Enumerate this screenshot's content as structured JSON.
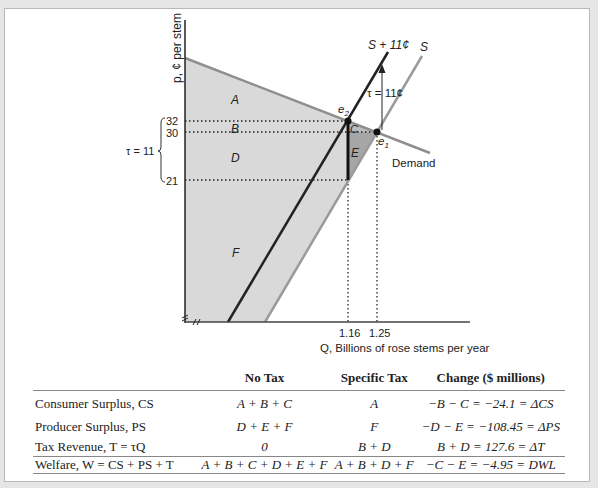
{
  "diagram": {
    "y_axis_label": "p, ¢ per stem",
    "x_axis_label": "Q, Billions of rose stems per year",
    "y_ticks": [
      "32",
      "30",
      "21"
    ],
    "x_ticks": [
      "1.16",
      "1.25"
    ],
    "tax_bracket_label": "τ = 11",
    "tax_arrow_label": "τ = 11¢",
    "curves": {
      "supply": "S",
      "supply_plus_tax": "S + 11¢",
      "demand": "Demand"
    },
    "points": {
      "e1": "e",
      "e1_sub": "1",
      "e2": "e",
      "e2_sub": "2"
    },
    "regions": {
      "A": "A",
      "B": "B",
      "C": "C",
      "D": "D",
      "E": "E",
      "F": "F"
    },
    "colors": {
      "surplus_fill": "#d9d9d9",
      "dwl_fill": "#a6a6a6",
      "supply_line": "#9a9a9a",
      "supply_tax_line": "#222222",
      "demand_line": "#8e8e8e",
      "axis": "#222222"
    }
  },
  "table": {
    "headers": [
      "",
      "No Tax",
      "Specific Tax",
      "Change ($ millions)"
    ],
    "rows": [
      {
        "label": "Consumer Surplus, CS",
        "no_tax": "A + B + C",
        "specific_tax": "A",
        "change": "−B − C = −24.1 = ΔCS"
      },
      {
        "label": "Producer Surplus, PS",
        "no_tax": "D + E + F",
        "specific_tax": "F",
        "change": "−D − E = −108.45 = ΔPS"
      },
      {
        "label": "Tax Revenue, T = τQ",
        "no_tax": "0",
        "specific_tax": "B + D",
        "change": "B + D = 127.6 = ΔT"
      },
      {
        "label": "Welfare, W = CS + PS + T",
        "no_tax": "A + B + C + D + E + F",
        "specific_tax": "A + B + D + F",
        "change": "−C − E = −4.95 = DWL"
      }
    ]
  }
}
